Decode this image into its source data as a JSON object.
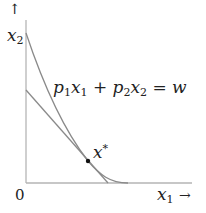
{
  "diagram": {
    "type": "consumer-choice / budget line tangent to indifference curve",
    "axes": {
      "origin_label": "0",
      "x_label": {
        "var": "x",
        "sub": "1",
        "arrow": "→"
      },
      "y_label": {
        "var": "x",
        "sub": "2",
        "arrow": "↑"
      }
    },
    "budget_line": {
      "equation": {
        "p1": "p",
        "p1_sub": "1",
        "x1": "x",
        "x1_sub": "1",
        "plus": "+",
        "p2": "p",
        "p2_sub": "2",
        "x2": "x",
        "x2_sub": "2",
        "eq": "=",
        "w": "w"
      },
      "text": "p1x1 + p2x2 = w"
    },
    "optimum_point": {
      "var": "x",
      "sup": "*"
    },
    "colors": {
      "axes": "#b5b5b5",
      "curves": "#8a8a8a",
      "point": "#111111",
      "text": "#222222"
    }
  }
}
